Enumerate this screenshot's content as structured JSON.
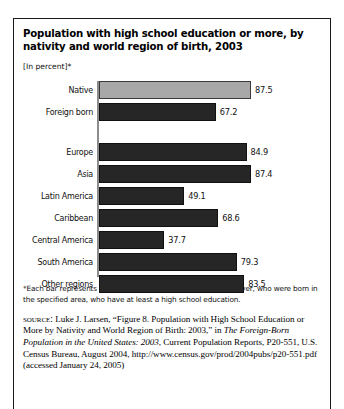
{
  "figure": {
    "title": "Population with high school education or more, by nativity and world region of birth, 2003",
    "units_note": "[In percent]*",
    "footnote": "*Each bar represents the percent of individuals aged 25 and over, who were born in the specified area, who have at least a high school education.",
    "source": {
      "label": "source:",
      "text_before_italic": " Luke J. Larsen, “Figure 8. Population with High School Education or More by Nativity and World Region of Birth: 2003,” in ",
      "italic_title": "The Foreign-Born Population in the United States: 2003",
      "text_after_italic": ", Current Population Reports, P20-551, U.S. Census Bureau, August 2004, http://www.census.gov/prod/2004pubs/p20-551.pdf (accessed January 24, 2005)"
    }
  },
  "chart_data": {
    "type": "bar",
    "orientation": "horizontal",
    "title": "Population with high school education or more, by nativity and world region of birth, 2003",
    "xlabel": "",
    "ylabel": "",
    "unit": "percent",
    "xlim": [
      0,
      87.5
    ],
    "grid": false,
    "legend": false,
    "categories": [
      "Native",
      "Foreign born",
      "Europe",
      "Asia",
      "Latin America",
      "Caribbean",
      "Central America",
      "South America",
      "Other regions"
    ],
    "values": [
      87.5,
      67.2,
      84.9,
      87.4,
      49.1,
      68.6,
      37.7,
      79.3,
      83.5
    ],
    "bars": [
      {
        "label": "Native",
        "value": 87.5,
        "display": "87.5",
        "color": "#a8a8a8",
        "group": "nativity"
      },
      {
        "label": "Foreign born",
        "value": 67.2,
        "display": "67.2",
        "color": "#262626",
        "group": "nativity"
      },
      {
        "label": "Europe",
        "value": 84.9,
        "display": "84.9",
        "color": "#262626",
        "group": "region"
      },
      {
        "label": "Asia",
        "value": 87.4,
        "display": "87.4",
        "color": "#262626",
        "group": "region"
      },
      {
        "label": "Latin America",
        "value": 49.1,
        "display": "49.1",
        "color": "#262626",
        "group": "region"
      },
      {
        "label": "Caribbean",
        "value": 68.6,
        "display": "68.6",
        "color": "#262626",
        "group": "region"
      },
      {
        "label": "Central America",
        "value": 37.7,
        "display": "37.7",
        "color": "#262626",
        "group": "region"
      },
      {
        "label": "South America",
        "value": 79.3,
        "display": "79.3",
        "color": "#262626",
        "group": "region"
      },
      {
        "label": "Other regions",
        "value": 83.5,
        "display": "83.5",
        "color": "#262626",
        "group": "region"
      }
    ]
  }
}
